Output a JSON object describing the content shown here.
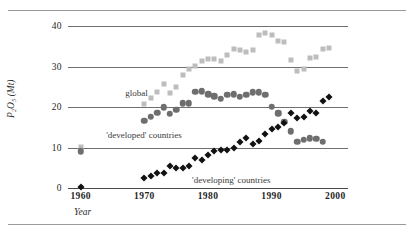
{
  "chart_data": {
    "type": "scatter",
    "title": "",
    "xlabel": "Year",
    "ylabel": "P₂O₅ (Mt)",
    "xlim": [
      1958,
      2002
    ],
    "ylim": [
      0,
      42
    ],
    "xticks": [
      1960,
      1970,
      1980,
      1990,
      2000
    ],
    "xticklabels": [
      "1960",
      "1970",
      "1980",
      "1990",
      "2000"
    ],
    "yticks": [
      0,
      10,
      20,
      30,
      40
    ],
    "yticklabels": [
      "0",
      "10",
      "20",
      "30",
      "40"
    ],
    "grid": true,
    "legend_position": "inline-annotations",
    "series": [
      {
        "name": "global",
        "marker": "square",
        "color": "#bdbdbd",
        "label": "global",
        "label_x": 1967.0,
        "label_y": 23.2,
        "points": [
          {
            "x": 1960,
            "y": 10.2
          },
          {
            "x": 1970,
            "y": 20.7
          },
          {
            "x": 1971,
            "y": 22.3
          },
          {
            "x": 1972,
            "y": 23.8
          },
          {
            "x": 1973,
            "y": 25.8
          },
          {
            "x": 1974,
            "y": 23.4
          },
          {
            "x": 1975,
            "y": 24.9
          },
          {
            "x": 1976,
            "y": 27.9
          },
          {
            "x": 1977,
            "y": 29.3
          },
          {
            "x": 1978,
            "y": 30.2
          },
          {
            "x": 1979,
            "y": 31.5
          },
          {
            "x": 1980,
            "y": 31.8
          },
          {
            "x": 1981,
            "y": 31.9
          },
          {
            "x": 1982,
            "y": 31.5
          },
          {
            "x": 1983,
            "y": 32.9
          },
          {
            "x": 1984,
            "y": 34.4
          },
          {
            "x": 1985,
            "y": 34.1
          },
          {
            "x": 1986,
            "y": 33.7
          },
          {
            "x": 1987,
            "y": 34.2
          },
          {
            "x": 1988,
            "y": 37.9
          },
          {
            "x": 1989,
            "y": 38.3
          },
          {
            "x": 1990,
            "y": 37.7
          },
          {
            "x": 1991,
            "y": 36.4
          },
          {
            "x": 1992,
            "y": 36.0
          },
          {
            "x": 1993,
            "y": 31.6
          },
          {
            "x": 1994,
            "y": 29.0
          },
          {
            "x": 1995,
            "y": 29.3
          },
          {
            "x": 1996,
            "y": 32.1
          },
          {
            "x": 1997,
            "y": 32.5
          },
          {
            "x": 1998,
            "y": 34.4
          },
          {
            "x": 1999,
            "y": 34.6
          }
        ]
      },
      {
        "name": "'developed' countries",
        "marker": "circle",
        "color": "#6e6e6e",
        "label": "'developed' countries",
        "label_x": 1964.0,
        "label_y": 12.9,
        "points": [
          {
            "x": 1960,
            "y": 9.1
          },
          {
            "x": 1970,
            "y": 16.6
          },
          {
            "x": 1971,
            "y": 17.6
          },
          {
            "x": 1972,
            "y": 18.6
          },
          {
            "x": 1973,
            "y": 20.0
          },
          {
            "x": 1974,
            "y": 18.3
          },
          {
            "x": 1975,
            "y": 19.3
          },
          {
            "x": 1976,
            "y": 20.9
          },
          {
            "x": 1977,
            "y": 21.0
          },
          {
            "x": 1978,
            "y": 23.8
          },
          {
            "x": 1979,
            "y": 23.9
          },
          {
            "x": 1980,
            "y": 23.2
          },
          {
            "x": 1981,
            "y": 22.7
          },
          {
            "x": 1982,
            "y": 22.1
          },
          {
            "x": 1983,
            "y": 23.1
          },
          {
            "x": 1984,
            "y": 23.2
          },
          {
            "x": 1985,
            "y": 22.6
          },
          {
            "x": 1986,
            "y": 23.1
          },
          {
            "x": 1987,
            "y": 23.7
          },
          {
            "x": 1988,
            "y": 23.7
          },
          {
            "x": 1989,
            "y": 23.0
          },
          {
            "x": 1990,
            "y": 20.1
          },
          {
            "x": 1991,
            "y": 18.5
          },
          {
            "x": 1992,
            "y": 16.4
          },
          {
            "x": 1993,
            "y": 14.0
          },
          {
            "x": 1994,
            "y": 11.5
          },
          {
            "x": 1995,
            "y": 11.9
          },
          {
            "x": 1996,
            "y": 12.3
          },
          {
            "x": 1997,
            "y": 12.2
          },
          {
            "x": 1998,
            "y": 11.5
          }
        ]
      },
      {
        "name": "'developing' countries",
        "marker": "diamond",
        "color": "#111111",
        "label": "'developing' countries",
        "label_x": 1977.5,
        "label_y": 1.7,
        "points": [
          {
            "x": 1960,
            "y": 0.3
          },
          {
            "x": 1970,
            "y": 2.6
          },
          {
            "x": 1971,
            "y": 3.1
          },
          {
            "x": 1972,
            "y": 3.6
          },
          {
            "x": 1973,
            "y": 3.8
          },
          {
            "x": 1974,
            "y": 5.5
          },
          {
            "x": 1975,
            "y": 4.9
          },
          {
            "x": 1976,
            "y": 5.0
          },
          {
            "x": 1977,
            "y": 5.4
          },
          {
            "x": 1978,
            "y": 7.4
          },
          {
            "x": 1979,
            "y": 6.9
          },
          {
            "x": 1980,
            "y": 8.1
          },
          {
            "x": 1981,
            "y": 9.1
          },
          {
            "x": 1982,
            "y": 9.3
          },
          {
            "x": 1983,
            "y": 9.4
          },
          {
            "x": 1984,
            "y": 10.0
          },
          {
            "x": 1985,
            "y": 11.4
          },
          {
            "x": 1986,
            "y": 12.3
          },
          {
            "x": 1987,
            "y": 10.9
          },
          {
            "x": 1988,
            "y": 11.6
          },
          {
            "x": 1989,
            "y": 13.4
          },
          {
            "x": 1990,
            "y": 14.7
          },
          {
            "x": 1991,
            "y": 15.1
          },
          {
            "x": 1992,
            "y": 16.0
          },
          {
            "x": 1993,
            "y": 18.5
          },
          {
            "x": 1994,
            "y": 17.3
          },
          {
            "x": 1995,
            "y": 17.5
          },
          {
            "x": 1996,
            "y": 19.1
          },
          {
            "x": 1997,
            "y": 18.6
          },
          {
            "x": 1998,
            "y": 21.5
          },
          {
            "x": 1999,
            "y": 22.4
          }
        ]
      }
    ]
  }
}
